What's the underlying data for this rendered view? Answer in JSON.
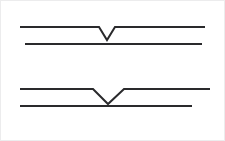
{
  "image": {
    "width": 225,
    "height": 141,
    "background_color": "#ffffff",
    "frame_color": "#ececed",
    "stroke_color": "#2a2a2c",
    "stroke_width": 2,
    "title": "Two schematic line diagrams with V-shaped notches"
  },
  "figures": [
    {
      "id": "top-figure",
      "name": "Top diagram",
      "notched_line": {
        "name": "Upper notched line",
        "points": "20,27 99,27 107,40 115,27 205,27",
        "start_x": 20,
        "end_x": 205,
        "baseline_y": 27,
        "notch_left_x": 99,
        "notch_right_x": 115,
        "notch_apex_x": 107,
        "notch_apex_y": 40,
        "notch_width": 16,
        "notch_depth": 13
      },
      "straight_line": {
        "name": "Lower straight line",
        "points": "25,44 202,44",
        "start_x": 25,
        "end_x": 202,
        "y": 44
      }
    },
    {
      "id": "bottom-figure",
      "name": "Bottom diagram",
      "notched_line": {
        "name": "Upper notched line",
        "points": "20,89 93,89 108,104 124,89 210,89",
        "start_x": 20,
        "end_x": 210,
        "baseline_y": 89,
        "notch_left_x": 93,
        "notch_right_x": 124,
        "notch_apex_x": 108,
        "notch_apex_y": 104,
        "notch_width": 31,
        "notch_depth": 15
      },
      "straight_line": {
        "name": "Lower straight line",
        "points": "20,106 192,106",
        "start_x": 20,
        "end_x": 192,
        "y": 106
      }
    }
  ]
}
